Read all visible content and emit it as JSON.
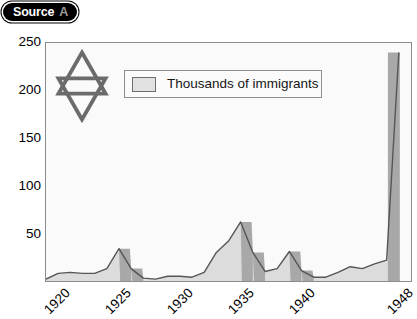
{
  "badge": {
    "name": "Source",
    "letter": "A"
  },
  "chart_data": {
    "type": "area",
    "title": "",
    "subtitle": "",
    "xlabel": "",
    "ylabel": "",
    "legend": [
      "Thousands of immigrants"
    ],
    "legend_position": "top-center",
    "grid": false,
    "xlim": [
      1919,
      1949
    ],
    "ylim": [
      0,
      250
    ],
    "yticks": [
      50,
      100,
      150,
      200,
      250
    ],
    "xticks": [
      1920,
      1925,
      1930,
      1935,
      1940,
      1948
    ],
    "xtick_labels": [
      "1920",
      "1925",
      "1930",
      "1935",
      "1940",
      "1948"
    ],
    "ytick_labels": [
      "50",
      "100",
      "150",
      "200",
      "250"
    ],
    "units": "thousands",
    "x": [
      1919,
      1920,
      1921,
      1922,
      1923,
      1924,
      1925,
      1926,
      1927,
      1928,
      1929,
      1930,
      1931,
      1932,
      1933,
      1934,
      1935,
      1936,
      1937,
      1938,
      1939,
      1940,
      1941,
      1942,
      1943,
      1944,
      1945,
      1946,
      1947,
      1948
    ],
    "values": [
      2,
      8,
      9,
      8,
      8,
      13,
      34,
      13,
      3,
      2,
      5,
      5,
      4,
      9,
      30,
      42,
      62,
      30,
      10,
      13,
      31,
      11,
      4,
      4,
      9,
      15,
      13,
      18,
      22,
      240
    ],
    "series": [
      {
        "name": "Thousands of immigrants",
        "values": [
          2,
          8,
          9,
          8,
          8,
          13,
          34,
          13,
          3,
          2,
          5,
          5,
          4,
          9,
          30,
          42,
          62,
          30,
          10,
          13,
          31,
          11,
          4,
          4,
          9,
          15,
          13,
          18,
          22,
          240
        ]
      }
    ],
    "annotations": [],
    "colors": {
      "area_fill": "#dcdcdc",
      "area_shade": "#a8a8a8",
      "line": "#555555",
      "axis": "#8c8c8c",
      "plot_background": "#fafafa",
      "text": "#000000"
    }
  },
  "icons": {
    "star_of_david": "star-of-david-icon"
  }
}
